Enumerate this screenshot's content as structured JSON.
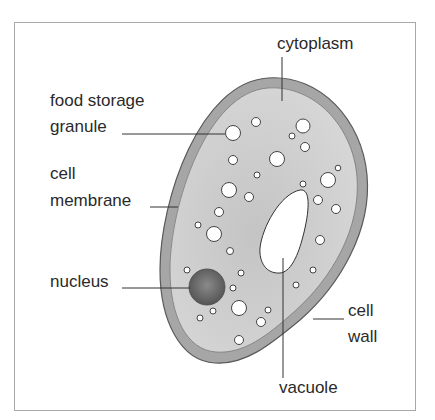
{
  "diagram": {
    "type": "labeled cell diagram",
    "labels": {
      "cytoplasm": "cytoplasm",
      "food_storage_line1": "food storage",
      "food_storage_line2": "granule",
      "cell_membrane_line1": "cell",
      "cell_membrane_line2": "membrane",
      "nucleus": "nucleus",
      "cell_wall_line1": "cell",
      "cell_wall_line2": "wall",
      "vacuole": "vacuole"
    },
    "colors": {
      "frame": "#a8a8a8",
      "cell_wall": "#a6a6a6",
      "cell_outline": "#5a5a5a",
      "cytoplasm": "#cfcfcf",
      "nucleus": "#6a6a6a",
      "vacuole": "#ffffff",
      "granule": "#ffffff",
      "leader_line": "#333333",
      "text": "#2a2a2a"
    }
  }
}
